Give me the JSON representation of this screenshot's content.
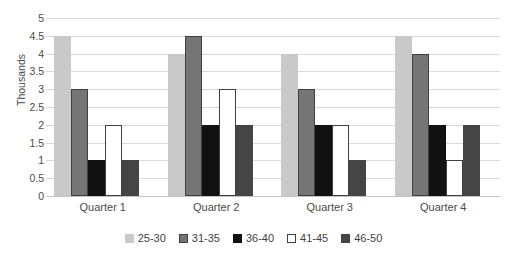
{
  "chart_data": {
    "type": "bar",
    "title": "Public School Enrollment",
    "xlabel": "",
    "ylabel": "Thousands",
    "ylim": [
      0,
      5
    ],
    "ytick_step": 0.5,
    "yticks": [
      "5",
      "4.5",
      "4",
      "3.5",
      "3",
      "2.5",
      "2",
      "1.5",
      "1",
      "0.5",
      "0"
    ],
    "grid": true,
    "legend_position": "bottom",
    "categories": [
      "Quarter 1",
      "Quarter 2",
      "Quarter 3",
      "Quarter 4"
    ],
    "series": [
      {
        "name": "25-30",
        "color": "#c9c9c9",
        "border": "#c9c9c9",
        "values": [
          4.5,
          4,
          4,
          4.5
        ]
      },
      {
        "name": "31-35",
        "color": "#757575",
        "border": "#3f3f3f",
        "values": [
          3,
          4.5,
          3,
          4
        ]
      },
      {
        "name": "36-40",
        "color": "#111111",
        "border": "#111111",
        "values": [
          1,
          2,
          2,
          2
        ]
      },
      {
        "name": "41-45",
        "color": "#ffffff",
        "border": "#3f3f3f",
        "values": [
          2,
          3,
          2,
          1
        ]
      },
      {
        "name": "46-50",
        "color": "#454545",
        "border": "#454545",
        "values": [
          1,
          2,
          1,
          2
        ]
      }
    ]
  },
  "colors": {
    "gridline": "#d9d9d9",
    "axis": "#c4c4c4",
    "text": "#4a4a4a",
    "background": "#ffffff"
  }
}
